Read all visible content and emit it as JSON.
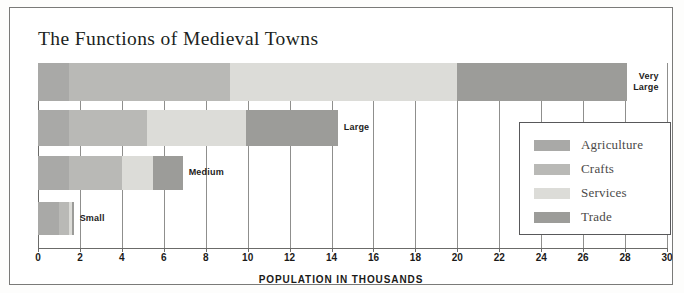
{
  "chart_data": {
    "type": "bar",
    "orientation": "horizontal",
    "stacked": true,
    "title": "The Functions of Medieval Towns",
    "xlabel": "POPULATION IN THOUSANDS",
    "ylabel": "",
    "xlim": [
      0,
      30
    ],
    "xticks": [
      0,
      2,
      4,
      6,
      8,
      10,
      12,
      14,
      16,
      18,
      20,
      22,
      24,
      26,
      28,
      30
    ],
    "xtick_labels": [
      "0",
      "2",
      "4",
      "6",
      "8",
      "10",
      "12",
      "14",
      "16",
      "18",
      "20",
      "22",
      "24",
      "26",
      "28",
      "30"
    ],
    "grid": true,
    "legend_position": "right",
    "categories": [
      "Very Large",
      "Large",
      "Medium",
      "Small"
    ],
    "series": [
      {
        "name": "Agriculture",
        "color": "#a9a9a7",
        "values": [
          1.5,
          1.5,
          1.5,
          1.0
        ]
      },
      {
        "name": "Crafts",
        "color": "#b9b9b6",
        "values": [
          7.65,
          3.7,
          2.5,
          0.5
        ]
      },
      {
        "name": "Services",
        "color": "#dcdcd8",
        "values": [
          10.85,
          4.7,
          1.5,
          0.1
        ]
      },
      {
        "name": "Trade",
        "color": "#9c9c99",
        "values": [
          8.1,
          4.4,
          1.4,
          0.1
        ]
      }
    ],
    "totals": [
      28.1,
      14.3,
      6.9,
      1.7
    ],
    "bar_labels": [
      "Very\nLarge",
      "Large",
      "Medium",
      "Small"
    ]
  },
  "legend": {
    "items": [
      {
        "label": "Agriculture",
        "color": "#a9a9a7"
      },
      {
        "label": "Crafts",
        "color": "#b9b9b6"
      },
      {
        "label": "Services",
        "color": "#dcdcd8"
      },
      {
        "label": "Trade",
        "color": "#9c9c99"
      }
    ]
  }
}
